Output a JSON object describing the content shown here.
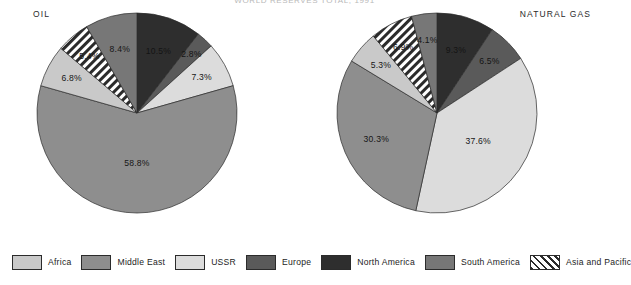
{
  "figure": {
    "top_title": "WORLD RESERVES TOTAL, 1991",
    "legend_position": "bottom"
  },
  "legend": {
    "items": [
      {
        "label": "Africa",
        "color": "#c9c9c9",
        "pattern": "solid"
      },
      {
        "label": "Middle East",
        "color": "#8e8e8e",
        "pattern": "solid"
      },
      {
        "label": "USSR",
        "color": "#dcdcdc",
        "pattern": "solid"
      },
      {
        "label": "Europe",
        "color": "#5a5a5a",
        "pattern": "solid"
      },
      {
        "label": "North America",
        "color": "#2e2e2e",
        "pattern": "solid"
      },
      {
        "label": "South America",
        "color": "#777777",
        "pattern": "solid"
      },
      {
        "label": "Asia and Pacific",
        "color": "#ffffff",
        "pattern": "diagonal-hatch"
      }
    ]
  },
  "chart_data": [
    {
      "type": "pie",
      "title": "OIL",
      "xlabel": "",
      "ylabel": "",
      "start_angle": 0,
      "direction": "clockwise",
      "categories": [
        "North America",
        "Europe",
        "USSR",
        "Middle East",
        "Africa",
        "Asia and Pacific",
        "South America"
      ],
      "values": [
        10.5,
        2.8,
        7.3,
        58.8,
        6.8,
        5.4,
        8.4
      ],
      "labels": [
        "10.5%",
        "2.8%",
        "7.3%",
        "58.8%",
        "6.8%",
        "5.4%",
        "8.4%"
      ],
      "colors": [
        "#2e2e2e",
        "#5a5a5a",
        "#dcdcdc",
        "#8e8e8e",
        "#c9c9c9",
        "#ffffff",
        "#777777"
      ],
      "patterns": [
        "solid",
        "solid",
        "solid",
        "solid",
        "solid",
        "diagonal-hatch",
        "solid"
      ],
      "total": 100.0
    },
    {
      "type": "pie",
      "title": "NATURAL GAS",
      "xlabel": "",
      "ylabel": "",
      "start_angle": 0,
      "direction": "clockwise",
      "categories": [
        "North America",
        "Europe",
        "USSR",
        "Middle East",
        "Africa",
        "Asia and Pacific",
        "South America"
      ],
      "values": [
        9.3,
        6.5,
        37.6,
        30.3,
        5.3,
        6.9,
        4.1
      ],
      "labels": [
        "9.3%",
        "6.5%",
        "37.6%",
        "30.3%",
        "5.3%",
        "6.9%",
        "4.1%"
      ],
      "colors": [
        "#2e2e2e",
        "#5a5a5a",
        "#dcdcdc",
        "#8e8e8e",
        "#c9c9c9",
        "#ffffff",
        "#777777"
      ],
      "patterns": [
        "solid",
        "solid",
        "solid",
        "solid",
        "solid",
        "diagonal-hatch",
        "solid"
      ],
      "total": 100.0
    }
  ]
}
